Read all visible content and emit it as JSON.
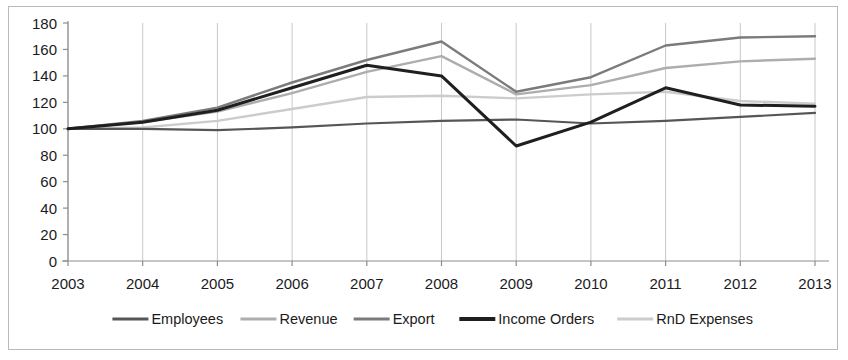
{
  "chart_data": {
    "type": "line",
    "title": "",
    "subtitle": "",
    "xlabel": "",
    "ylabel": "",
    "categories": [
      "2003",
      "2004",
      "2005",
      "2006",
      "2007",
      "2008",
      "2009",
      "2010",
      "2011",
      "2012",
      "2013"
    ],
    "ylim": [
      0,
      180
    ],
    "ytick_values": [
      0,
      20,
      40,
      60,
      80,
      100,
      120,
      140,
      160,
      180
    ],
    "ytick_labels": [
      "0",
      "20",
      "40",
      "60",
      "80",
      "100",
      "120",
      "140",
      "160",
      "180"
    ],
    "grid": "vertical",
    "legend_position": "bottom",
    "series": [
      {
        "name": "Employees",
        "color": "#565656",
        "width": 2.2,
        "values": [
          100,
          100,
          99,
          101,
          104,
          106,
          107,
          104,
          106,
          109,
          112
        ]
      },
      {
        "name": "Revenue",
        "color": "#adadad",
        "width": 2.4,
        "values": [
          100,
          105,
          113,
          127,
          143,
          155,
          126,
          133,
          146,
          151,
          153
        ]
      },
      {
        "name": "Export",
        "color": "#7b7b7b",
        "width": 2.4,
        "values": [
          100,
          106,
          116,
          135,
          152,
          166,
          128,
          139,
          163,
          169,
          170
        ]
      },
      {
        "name": "Income Orders",
        "color": "#1f1f1f",
        "width": 3.0,
        "values": [
          100,
          105,
          114,
          131,
          148,
          140,
          87,
          105,
          131,
          118,
          117
        ]
      },
      {
        "name": "RnD Expenses",
        "color": "#cccccc",
        "width": 2.4,
        "values": [
          100,
          101,
          106,
          115,
          124,
          125,
          123,
          126,
          128,
          121,
          119
        ]
      }
    ]
  },
  "legend": {
    "items": [
      {
        "label": "Employees",
        "color": "#565656",
        "width": 3.2
      },
      {
        "label": "Revenue",
        "color": "#adadad",
        "width": 3.2
      },
      {
        "label": "Export",
        "color": "#7b7b7b",
        "width": 3.2
      },
      {
        "label": "Income Orders",
        "color": "#1f1f1f",
        "width": 4.0
      },
      {
        "label": "RnD Expenses",
        "color": "#cccccc",
        "width": 3.2
      }
    ]
  },
  "colors": {
    "frame_border": "#b9b9b9",
    "gridline": "#c8c8c8",
    "axis": "#8d8d8d",
    "text": "#1b1b1b",
    "background": "#ffffff"
  }
}
